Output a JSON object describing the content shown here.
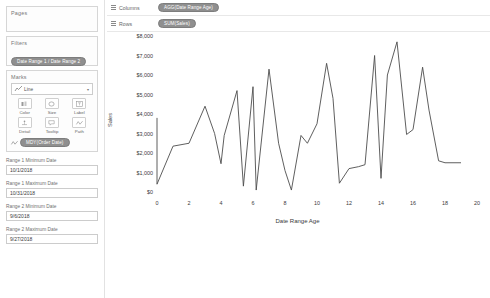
{
  "sidebar": {
    "pages": {
      "title": "Pages"
    },
    "filters": {
      "title": "Filters",
      "pills": [
        {
          "label": "Date Range 1 / Date Range 2",
          "icon": "filter-pill"
        }
      ]
    },
    "marks": {
      "title": "Marks",
      "mark_type": "Line",
      "mark_type_icon": "line-chart-icon",
      "buttons": [
        {
          "label": "Color",
          "icon": "color-icon"
        },
        {
          "label": "Size",
          "icon": "size-icon"
        },
        {
          "label": "Label",
          "icon": "label-icon"
        },
        {
          "label": "Detail",
          "icon": "detail-icon"
        },
        {
          "label": "Tooltip",
          "icon": "tooltip-icon"
        },
        {
          "label": "Path",
          "icon": "path-icon"
        }
      ],
      "pills": [
        {
          "label": "MDY(Order Date)",
          "icon": "path-icon"
        }
      ]
    },
    "parameters": [
      {
        "label": "Range 1 Minimum Date",
        "value": "10/1/2018"
      },
      {
        "label": "Range 1 Maximum Date",
        "value": "10/31/2018"
      },
      {
        "label": "Range 2 Minimum Date",
        "value": "9/6/2018"
      },
      {
        "label": "Range 2 Maximum Date",
        "value": "9/27/2018"
      }
    ]
  },
  "shelves": {
    "columns": {
      "label": "Columns",
      "icon": "columns-icon",
      "pill": "AGG(Date Range Age)"
    },
    "rows": {
      "label": "Rows",
      "icon": "rows-icon",
      "pill": "SUM(Sales)"
    }
  },
  "colors": {
    "line": "#4d4d4d",
    "pill": "#8f8f8f",
    "axis_text": "#3a3a3a",
    "panel_border": "#d6d6d6"
  },
  "chart_data": {
    "type": "line",
    "title": "",
    "xlabel": "Date Range Age",
    "ylabel": "Sales",
    "xlim": [
      0,
      20
    ],
    "ylim": [
      0,
      8000
    ],
    "xticks": [
      0,
      2,
      4,
      6,
      8,
      10,
      12,
      14,
      16,
      18,
      20
    ],
    "xticklabels": [
      "0",
      "2",
      "4",
      "6",
      "8",
      "10",
      "12",
      "14",
      "16",
      "18",
      "20"
    ],
    "yticks": [
      0,
      1000,
      2000,
      3000,
      4000,
      5000,
      6000,
      7000,
      8000
    ],
    "yticklabels": [
      "$0",
      "$1,000",
      "$2,000",
      "$3,000",
      "$4,000",
      "$5,000",
      "$6,000",
      "$7,000",
      "$8,000"
    ],
    "grid": false,
    "legend": false,
    "series": [
      {
        "name": "Sales",
        "color": "#4d4d4d",
        "x": [
          0,
          0,
          1,
          2,
          3,
          3.6,
          4,
          4.2,
          5,
          5.4,
          6,
          6.2,
          7,
          7.6,
          8,
          8.4,
          9,
          9.4,
          10,
          10.6,
          11,
          11.4,
          12,
          12.6,
          13,
          13.6,
          14,
          14.4,
          15,
          15.6,
          16,
          16.6,
          17,
          17.6,
          18,
          19
        ],
        "y": [
          3800,
          400,
          2350,
          2500,
          4400,
          3000,
          1450,
          2900,
          5200,
          300,
          5400,
          100,
          6300,
          2500,
          1100,
          100,
          2900,
          2500,
          3500,
          6600,
          4800,
          450,
          1200,
          1300,
          1400,
          7000,
          700,
          6000,
          7700,
          2950,
          3200,
          6400,
          4200,
          1600,
          1500,
          1500
        ]
      }
    ]
  }
}
